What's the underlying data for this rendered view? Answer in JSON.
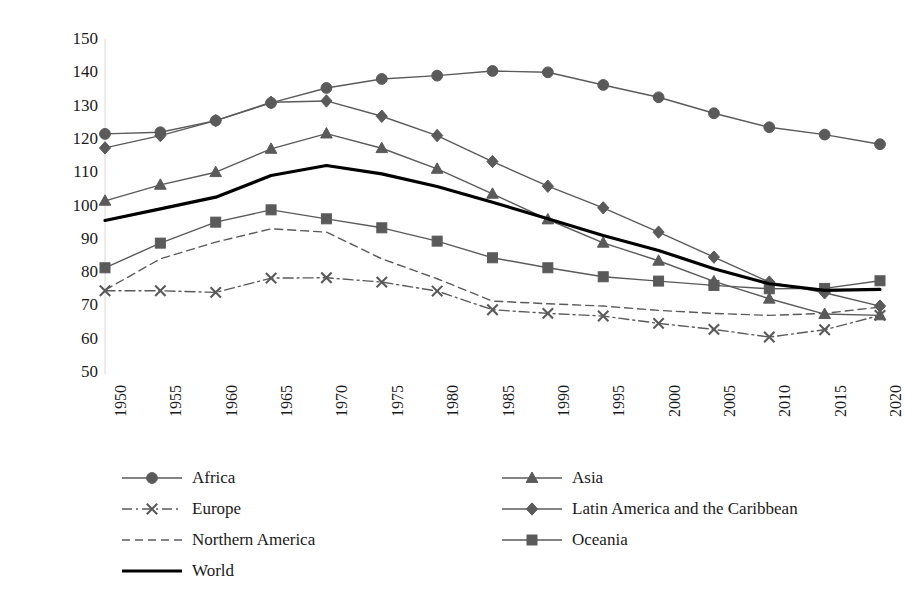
{
  "chart_data": {
    "type": "line",
    "title": "",
    "xlabel": "",
    "ylabel": "Total Dependency Ratio",
    "ylim": [
      50,
      150
    ],
    "yticks": [
      150,
      140,
      130,
      120,
      110,
      100,
      90,
      80,
      70,
      60,
      50
    ],
    "grid": false,
    "legend_position": "bottom",
    "categories": [
      "1950",
      "1955",
      "1960",
      "1965",
      "1970",
      "1975",
      "1980",
      "1985",
      "1990",
      "1995",
      "2000",
      "2005",
      "2010",
      "2015",
      "2020"
    ],
    "series": [
      {
        "name": "Africa",
        "marker": "circle",
        "line_style": "solid",
        "color": "#5a5a5a",
        "values": [
          121.5,
          122.0,
          125.5,
          130.8,
          135.3,
          138.0,
          139.0,
          140.4,
          140.0,
          136.2,
          132.5,
          127.7,
          123.5,
          121.3,
          118.4
        ]
      },
      {
        "name": "Asia",
        "marker": "triangle",
        "line_style": "solid",
        "color": "#5a5a5a",
        "values": [
          101.4,
          106.2,
          110.0,
          117.0,
          121.6,
          117.2,
          111.0,
          103.5,
          95.8,
          88.8,
          83.4,
          77.2,
          72.0,
          67.4,
          67.0
        ]
      },
      {
        "name": "Europe",
        "marker": "cross",
        "line_style": "dash-dot",
        "color": "#5a5a5a",
        "values": [
          74.4,
          74.4,
          73.9,
          78.2,
          78.3,
          77.0,
          74.3,
          68.7,
          67.6,
          66.8,
          64.6,
          62.8,
          60.5,
          62.7,
          67.0
        ]
      },
      {
        "name": "Latin America and the Caribbean",
        "marker": "diamond",
        "line_style": "solid",
        "color": "#5a5a5a",
        "values": [
          117.3,
          121.0,
          125.5,
          131.0,
          131.4,
          126.8,
          121.0,
          113.2,
          105.8,
          99.3,
          92.0,
          84.5,
          77.0,
          73.8,
          69.8
        ]
      },
      {
        "name": "Northern America",
        "marker": "none",
        "line_style": "dashed",
        "color": "#5a5a5a",
        "values": [
          74.6,
          84.0,
          89.0,
          93.0,
          92.0,
          84.0,
          78.0,
          71.3,
          70.5,
          69.8,
          68.5,
          67.6,
          67.0,
          67.6,
          69.5
        ]
      },
      {
        "name": "Oceania",
        "marker": "square",
        "line_style": "solid",
        "color": "#5a5a5a",
        "values": [
          81.3,
          88.7,
          95.0,
          98.7,
          96.0,
          93.3,
          89.3,
          84.3,
          81.3,
          78.6,
          77.3,
          76.0,
          75.0,
          75.1,
          77.4
        ]
      },
      {
        "name": "World",
        "marker": "none",
        "line_style": "thick-solid",
        "color": "#000000",
        "values": [
          95.5,
          99.0,
          102.5,
          109.0,
          112.0,
          109.5,
          105.7,
          101.0,
          96.0,
          91.0,
          86.5,
          81.0,
          76.5,
          74.5,
          74.8
        ]
      }
    ]
  },
  "legend": {
    "rows": [
      [
        {
          "label": "Africa",
          "marker": "circle",
          "line_style": "solid"
        },
        {
          "label": "Asia",
          "marker": "triangle",
          "line_style": "solid"
        }
      ],
      [
        {
          "label": "Europe",
          "marker": "cross",
          "line_style": "dash-dot"
        },
        {
          "label": "Latin America and the Caribbean",
          "marker": "diamond",
          "line_style": "solid"
        }
      ],
      [
        {
          "label": "Northern America",
          "marker": "none",
          "line_style": "dashed"
        },
        {
          "label": "Oceania",
          "marker": "square",
          "line_style": "solid"
        }
      ],
      [
        {
          "label": "World",
          "marker": "none",
          "line_style": "thick-solid"
        }
      ]
    ]
  }
}
